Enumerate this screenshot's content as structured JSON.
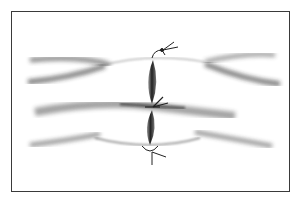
{
  "figure": {
    "frame_color": "#3a3a3a",
    "shade_color": "#2a2a2a",
    "background": "#ffffff",
    "knots": [
      {
        "position": "top",
        "x": 160,
        "y": 55
      },
      {
        "position": "middle",
        "x": 152,
        "y": 107
      },
      {
        "position": "bottom",
        "x": 150,
        "y": 148
      }
    ]
  }
}
